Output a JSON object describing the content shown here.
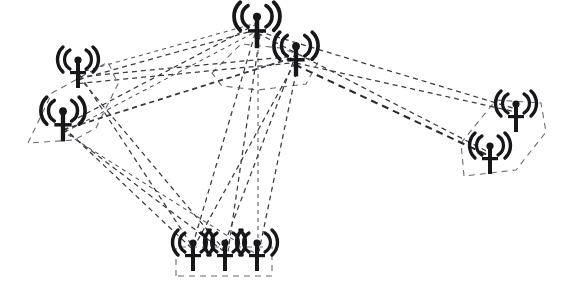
{
  "figure": {
    "background_color": "#ffffff",
    "width": 568,
    "height": 290,
    "node_icon": "antenna-tower-icon",
    "link_style": "dashed",
    "link_color": "#3a3a3f",
    "boundary_color": "#6b6b73",
    "node_color": "#17171a"
  },
  "chart_data": {
    "type": "diagram",
    "xlabel": "",
    "ylabel": "",
    "grid": false,
    "legend": false,
    "xlim": [
      0,
      568
    ],
    "ylim": [
      0,
      290
    ],
    "nodes": [
      {
        "id": "n1",
        "label": "",
        "group": "left-cluster",
        "x": 78,
        "y": 70,
        "scale": 1.0
      },
      {
        "id": "n2",
        "label": "",
        "group": "left-cluster",
        "x": 63,
        "y": 122,
        "scale": 1.08
      },
      {
        "id": "n3",
        "label": "",
        "group": "top-cluster",
        "x": 257,
        "y": 28,
        "scale": 1.12
      },
      {
        "id": "n4",
        "label": "",
        "group": "top-cluster",
        "x": 296,
        "y": 57,
        "scale": 1.08
      },
      {
        "id": "n5",
        "label": "",
        "group": "bottom-cluster",
        "x": 193,
        "y": 253,
        "scale": 1.0
      },
      {
        "id": "n6",
        "label": "",
        "group": "bottom-cluster",
        "x": 225,
        "y": 253,
        "scale": 1.0
      },
      {
        "id": "n7",
        "label": "",
        "group": "bottom-cluster",
        "x": 257,
        "y": 253,
        "scale": 1.0
      },
      {
        "id": "n8",
        "label": "",
        "group": "right-cluster",
        "x": 516,
        "y": 114,
        "scale": 1.0
      },
      {
        "id": "n9",
        "label": "",
        "group": "right-cluster",
        "x": 490,
        "y": 156,
        "scale": 1.0
      }
    ],
    "groups": [
      {
        "id": "left-cluster",
        "boundary": [
          [
            28,
            143
          ],
          [
            52,
            93
          ],
          [
            108,
            62
          ],
          [
            118,
            84
          ],
          [
            96,
            128
          ],
          [
            74,
            140
          ]
        ]
      },
      {
        "id": "top-cluster",
        "boundary": [
          [
            212,
            73
          ],
          [
            241,
            44
          ],
          [
            281,
            48
          ],
          [
            318,
            62
          ],
          [
            306,
            84
          ],
          [
            258,
            90
          ],
          [
            222,
            86
          ]
        ]
      },
      {
        "id": "bottom-cluster",
        "boundary": [
          [
            176,
            276
          ],
          [
            176,
            247
          ],
          [
            272,
            247
          ],
          [
            272,
            276
          ]
        ]
      },
      {
        "id": "right-cluster",
        "boundary": [
          [
            464,
            176
          ],
          [
            461,
            143
          ],
          [
            496,
            100
          ],
          [
            541,
            103
          ],
          [
            546,
            132
          ],
          [
            516,
            170
          ]
        ]
      }
    ],
    "links": [
      {
        "from": "n1",
        "to": "n3",
        "weight": 1
      },
      {
        "from": "n1",
        "to": "n3",
        "weight": 1
      },
      {
        "from": "n1",
        "to": "n4",
        "weight": 1
      },
      {
        "from": "n1",
        "to": "n4",
        "weight": 1
      },
      {
        "from": "n2",
        "to": "n3",
        "weight": 1
      },
      {
        "from": "n2",
        "to": "n3",
        "weight": 1
      },
      {
        "from": "n2",
        "to": "n4",
        "weight": 1
      },
      {
        "from": "n2",
        "to": "n4",
        "weight": 1
      },
      {
        "from": "n2",
        "to": "n5",
        "weight": 1
      },
      {
        "from": "n2",
        "to": "n6",
        "weight": 1
      },
      {
        "from": "n2",
        "to": "n7",
        "weight": 1
      },
      {
        "from": "n1",
        "to": "n5",
        "weight": 1
      },
      {
        "from": "n1",
        "to": "n6",
        "weight": 1
      },
      {
        "from": "n3",
        "to": "n5",
        "weight": 1
      },
      {
        "from": "n3",
        "to": "n6",
        "weight": 1
      },
      {
        "from": "n3",
        "to": "n7",
        "weight": 1
      },
      {
        "from": "n4",
        "to": "n5",
        "weight": 1
      },
      {
        "from": "n4",
        "to": "n6",
        "weight": 1
      },
      {
        "from": "n4",
        "to": "n7",
        "weight": 1
      },
      {
        "from": "n4",
        "to": "n8",
        "weight": 1
      },
      {
        "from": "n4",
        "to": "n9",
        "weight": 2
      },
      {
        "from": "n3",
        "to": "n8",
        "weight": 1
      },
      {
        "from": "n3",
        "to": "n9",
        "weight": 1
      }
    ]
  }
}
